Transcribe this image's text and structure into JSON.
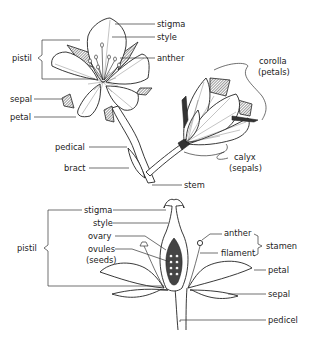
{
  "diagram": {
    "top_flower": {
      "labels": {
        "stigma": "stigma",
        "style": "style",
        "anther": "anther",
        "pistil": "pistil",
        "sepal": "sepal",
        "petal": "petal",
        "pedical": "pedical",
        "bract": "bract",
        "stem": "stem",
        "corolla": "corolla",
        "corolla_sub": "(petals)",
        "calyx": "calyx",
        "calyx_sub": "(sepals)"
      }
    },
    "cross_section": {
      "labels": {
        "stigma": "stigma",
        "style": "style",
        "ovary": "ovary",
        "ovules": "ovules",
        "ovules_sub": "(seeds)",
        "pistil": "pistil",
        "anther": "anther",
        "filament": "filament",
        "stamen": "stamen",
        "petal": "petal",
        "sepal": "sepal",
        "pedicel": "pedicel"
      }
    }
  }
}
